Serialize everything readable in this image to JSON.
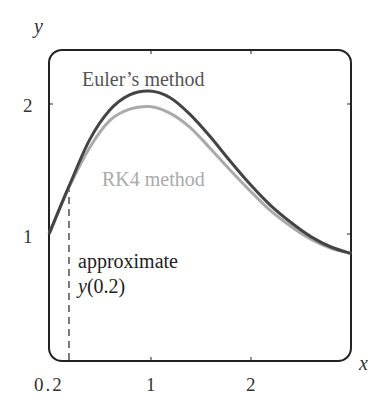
{
  "chart_data": {
    "type": "line",
    "title": "",
    "xlabel": "x",
    "ylabel": "y",
    "xlim": [
      0,
      3
    ],
    "ylim": [
      0,
      2.4
    ],
    "grid": false,
    "x_ticks": [
      {
        "value": 0.2,
        "label": "0.2"
      },
      {
        "value": 1,
        "label": "1"
      },
      {
        "value": 2,
        "label": "2"
      }
    ],
    "y_ticks": [
      {
        "value": 1,
        "label": "1"
      },
      {
        "value": 2,
        "label": "2"
      }
    ],
    "series": [
      {
        "name": "Euler's method",
        "color": "#444444",
        "x": [
          0,
          0.2,
          0.4,
          0.6,
          0.8,
          1.0,
          1.2,
          1.4,
          1.6,
          1.8,
          2.0,
          2.2,
          2.4,
          2.6,
          2.8,
          3.0
        ],
        "y": [
          1.0,
          1.37,
          1.72,
          1.95,
          2.07,
          2.1,
          2.05,
          1.92,
          1.75,
          1.56,
          1.38,
          1.22,
          1.09,
          0.98,
          0.9,
          0.85
        ]
      },
      {
        "name": "RK4 method",
        "color": "#aaaaaa",
        "x": [
          0,
          0.2,
          0.4,
          0.6,
          0.8,
          1.0,
          1.2,
          1.4,
          1.6,
          1.8,
          2.0,
          2.2,
          2.4,
          2.6,
          2.8,
          3.0
        ],
        "y": [
          1.0,
          1.36,
          1.66,
          1.87,
          1.96,
          1.98,
          1.93,
          1.82,
          1.66,
          1.49,
          1.33,
          1.18,
          1.06,
          0.96,
          0.89,
          0.85
        ]
      }
    ],
    "annotations": [
      {
        "text": "Euler's method",
        "x": 0.38,
        "y": 2.22
      },
      {
        "text": "RK4 method",
        "x": 0.52,
        "y": 1.37
      },
      {
        "text": "approximate",
        "x": 0.25,
        "y": 0.87
      },
      {
        "text": "y(0.2)",
        "x": 0.25,
        "y": 0.62
      },
      {
        "text": "dashed vertical line at x = 0.2",
        "x": 0.2
      }
    ],
    "legend_position": "inline labels"
  },
  "labels": {
    "x_axis": "x",
    "y_axis": "y",
    "tick_x_02": "0.2",
    "tick_x_1": "1",
    "tick_x_2": "2",
    "tick_y_1": "1",
    "tick_y_2": "2",
    "euler": "Euler’s method",
    "rk4": "RK4 method",
    "approx_line1": "approximate",
    "approx_line2_y": "y",
    "approx_line2_arg": "(0.2)"
  },
  "colors": {
    "euler": "#444444",
    "rk4": "#aaaaaa",
    "frame": "#222222"
  }
}
